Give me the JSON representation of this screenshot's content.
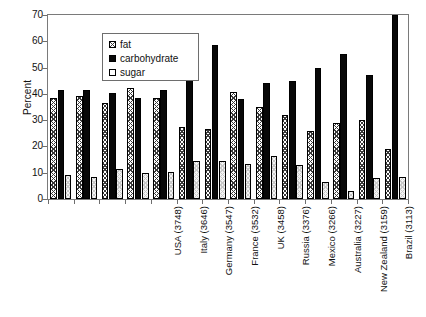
{
  "chart_data": {
    "type": "bar",
    "title": "",
    "subtitle": "",
    "xlabel": "",
    "ylabel": "Percent",
    "ylim": [
      0,
      70
    ],
    "yticks": [
      0,
      10,
      20,
      30,
      40,
      50,
      60,
      70
    ],
    "grid": false,
    "legend_position": "top-left",
    "categories": [
      "USA (3748)",
      "Italy (3646)",
      "Germany (3547)",
      "France (3532)",
      "UK (3458)",
      "Russia (3376)",
      "Mexico (3266)",
      "Australia (3227)",
      "New Zealand (3159)",
      "Brazil (3113)",
      "South Korea (3074)",
      "China (2981)",
      "Japan (2812)",
      "India (2352)"
    ],
    "series": [
      {
        "name": "fat",
        "pattern": "crosshatch",
        "values": [
          38.3,
          39.3,
          36.5,
          42.3,
          38.5,
          27.5,
          26.5,
          40.7,
          35.0,
          32.0,
          26.0,
          29.0,
          30.2,
          19.0
        ]
      },
      {
        "name": "carbohydrate",
        "pattern": "solid-black",
        "values": [
          41.3,
          41.3,
          40.5,
          38.5,
          41.4,
          56.5,
          58.5,
          38.0,
          44.0,
          45.0,
          50.0,
          55.0,
          47.0,
          70.0
        ]
      },
      {
        "name": "sugar",
        "pattern": "light-dotted",
        "values": [
          9.0,
          8.5,
          11.5,
          9.9,
          10.2,
          14.3,
          14.6,
          13.5,
          16.3,
          13.1,
          6.5,
          3.2,
          8.0,
          8.3
        ]
      }
    ]
  },
  "legend": {
    "items": [
      {
        "label": "fat",
        "key": "fat"
      },
      {
        "label": "carbohydrate",
        "key": "carbohydrate"
      },
      {
        "label": "sugar",
        "key": "sugar"
      }
    ]
  },
  "axes": {
    "y_title": "Percent"
  }
}
